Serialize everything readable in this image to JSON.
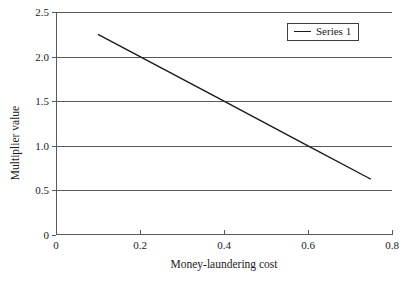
{
  "chart_data": {
    "type": "line",
    "title": "",
    "xlabel": "Money-laundering cost",
    "ylabel": "Multiplier value",
    "xlim": [
      0,
      0.8
    ],
    "ylim": [
      0,
      2.5
    ],
    "xticks": [
      "0",
      "0.2",
      "0.4",
      "0.6",
      "0.8"
    ],
    "xtick_values": [
      0,
      0.2,
      0.4,
      0.6,
      0.8
    ],
    "yticks": [
      "0",
      "0.5",
      "1.0",
      "1.5",
      "2.0",
      "2.5"
    ],
    "ytick_values": [
      0,
      0.5,
      1.0,
      1.5,
      2.0,
      2.5
    ],
    "grid": "horizontal",
    "legend_position": "top-right",
    "series": [
      {
        "name": "Series 1",
        "color": "#1a1a1a",
        "x": [
          0.1,
          0.2,
          0.4,
          0.6,
          0.75
        ],
        "values": [
          2.25,
          2.0,
          1.5,
          1.0,
          0.625
        ]
      }
    ]
  },
  "legend": {
    "entries": [
      {
        "label": "Series 1"
      }
    ]
  }
}
